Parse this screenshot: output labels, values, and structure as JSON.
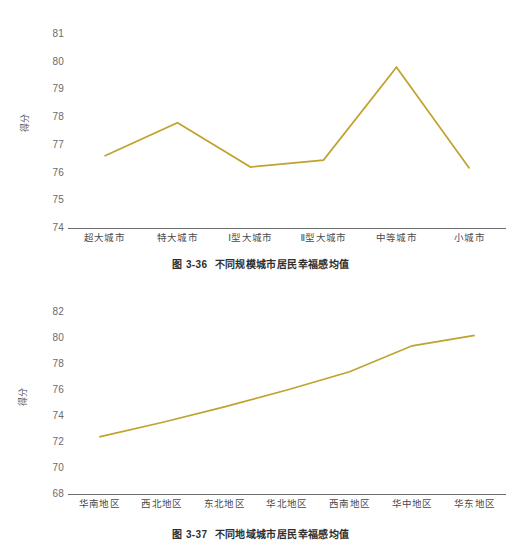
{
  "page": {
    "background": "#ffffff",
    "line_color": "#bfa32e",
    "axis_color": "#6e6e70",
    "text_color": "#58585a"
  },
  "figures": [
    {
      "id": "figure-1",
      "caption_number": "图 3-36",
      "caption_text": "不同规模城市居民幸福感均值",
      "yaxis_title": "得分",
      "yticks": [
        "81",
        "80",
        "79",
        "78",
        "77",
        "76",
        "75",
        "74"
      ],
      "xlabels": [
        "超大城市",
        "特大城市",
        "Ⅰ型大城市",
        "Ⅱ型大城市",
        "中等城市",
        "小城市"
      ]
    },
    {
      "id": "figure-2",
      "caption_number": "图 3-37",
      "caption_text": "不同地域城市居民幸福感均值",
      "yaxis_title": "得分",
      "yticks": [
        "82",
        "80",
        "78",
        "76",
        "74",
        "72",
        "70",
        "68"
      ],
      "xlabels": [
        "华南地区",
        "西北地区",
        "东北地区",
        "华北地区",
        "西南地区",
        "华中地区",
        "华东地区"
      ]
    }
  ],
  "chart_data": [
    {
      "type": "line",
      "title": "图 3-36 不同规模城市居民幸福感均值",
      "xlabel": "",
      "ylabel": "得分",
      "categories": [
        "超大城市",
        "特大城市",
        "Ⅰ型大城市",
        "Ⅱ型大城市",
        "中等城市",
        "小城市"
      ],
      "values": [
        76.6,
        77.8,
        76.2,
        76.45,
        79.8,
        76.15
      ],
      "ylim": [
        74,
        81
      ],
      "ytick_values": [
        74,
        75,
        76,
        77,
        78,
        79,
        80,
        81
      ],
      "grid": false,
      "legend": false,
      "series_color": "#bfa32e"
    },
    {
      "type": "line",
      "title": "图 3-37 不同地域城市居民幸福感均值",
      "xlabel": "",
      "ylabel": "得分",
      "categories": [
        "华南地区",
        "西北地区",
        "东北地区",
        "华北地区",
        "西南地区",
        "华中地区",
        "华东地区"
      ],
      "values": [
        72.4,
        73.5,
        74.7,
        76.0,
        77.4,
        79.4,
        80.2
      ],
      "ylim": [
        68,
        82
      ],
      "ytick_values": [
        68,
        70,
        72,
        74,
        76,
        78,
        80,
        82
      ],
      "grid": false,
      "legend": false,
      "series_color": "#bfa32e"
    }
  ]
}
